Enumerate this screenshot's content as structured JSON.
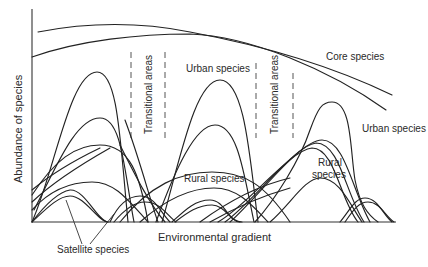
{
  "figure": {
    "y_axis_label": "Abundance of species",
    "x_axis_label": "Environmental gradient",
    "labels": {
      "core_species": "Core species",
      "urban_species_top": "Urban species",
      "urban_species_right": "Urban species",
      "rural_species_middle": "Rural species",
      "rural_species_right_line1": "Rural",
      "rural_species_right_line2": "species",
      "transitional_areas_1": "Transitional areas",
      "transitional_areas_2": "Transitional areas",
      "satellite_species": "Satellite species"
    },
    "colors": {
      "line": "#222222",
      "dashed": "#555555",
      "text": "#2a2a2a",
      "background": "#ffffff"
    }
  }
}
